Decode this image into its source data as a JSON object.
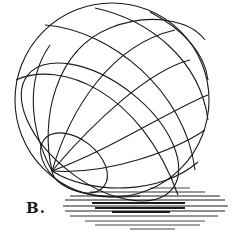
{
  "figure": {
    "label": "B.",
    "colors": {
      "stroke": "#1a1a1a",
      "background": "#ffffff"
    },
    "sphere": {
      "cx": 112,
      "cy": 100,
      "r": 97
    },
    "pole": {
      "x": 52,
      "y": 171
    },
    "shadow_lines": [
      {
        "x1": 150,
        "x2": 190,
        "y": 188,
        "w": 0.8
      },
      {
        "x1": 90,
        "x2": 205,
        "y": 192,
        "w": 0.9
      },
      {
        "x1": 70,
        "x2": 220,
        "y": 196,
        "w": 1.0
      },
      {
        "x1": 65,
        "x2": 225,
        "y": 200,
        "w": 1.0
      },
      {
        "x1": 92,
        "x2": 185,
        "y": 203,
        "w": 2.0
      },
      {
        "x1": 63,
        "x2": 228,
        "y": 206,
        "w": 1.0
      },
      {
        "x1": 95,
        "x2": 185,
        "y": 208,
        "w": 2.0
      },
      {
        "x1": 65,
        "x2": 225,
        "y": 211,
        "w": 1.0
      },
      {
        "x1": 112,
        "x2": 170,
        "y": 212,
        "w": 2.0
      },
      {
        "x1": 70,
        "x2": 218,
        "y": 216,
        "w": 0.9
      },
      {
        "x1": 85,
        "x2": 205,
        "y": 221,
        "w": 0.8
      },
      {
        "x1": 95,
        "x2": 200,
        "y": 225,
        "w": 0.8
      },
      {
        "x1": 130,
        "x2": 175,
        "y": 229,
        "w": 0.8
      }
    ]
  }
}
